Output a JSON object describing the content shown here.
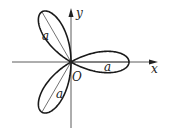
{
  "diagram": {
    "type": "polar-rose",
    "axes": {
      "x_label": "x",
      "y_label": "y",
      "origin_label": "O"
    },
    "petals": [
      {
        "direction_deg": 0,
        "length_label": "a"
      },
      {
        "direction_deg": 120,
        "length_label": "a"
      },
      {
        "direction_deg": 240,
        "length_label": "a"
      }
    ],
    "colors": {
      "stroke": "#1a1a1a",
      "background": "#ffffff"
    }
  }
}
